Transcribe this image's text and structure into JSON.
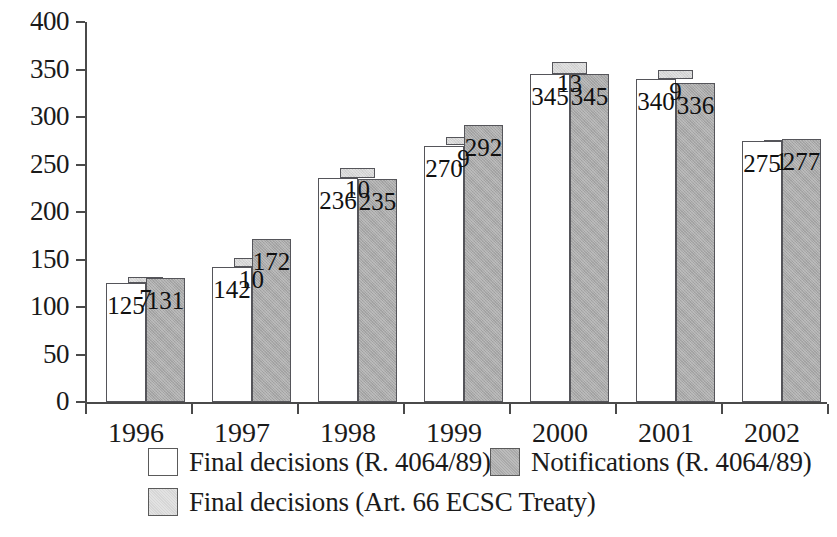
{
  "chart_data": {
    "type": "bar",
    "title": "",
    "subtitle": "",
    "xlabel": "",
    "ylabel": "",
    "categories": [
      "1996",
      "1997",
      "1998",
      "1999",
      "2000",
      "2001",
      "2002"
    ],
    "ylim": [
      0,
      400
    ],
    "yticks": [
      0,
      50,
      100,
      150,
      200,
      250,
      300,
      350,
      400
    ],
    "ytick_labels": [
      "0",
      "50",
      "100",
      "150",
      "200",
      "250",
      "300",
      "350",
      "400"
    ],
    "grid": false,
    "legend_position": "bottom-left",
    "stacking": "light-gray series is drawn stacked on top of the white series",
    "series": [
      {
        "name": "Final decisions (R. 4064/89)",
        "color": "#ffffff",
        "values": [
          125,
          142,
          236,
          270,
          345,
          340,
          275
        ],
        "labels": [
          "125",
          "142",
          "236",
          "270",
          "345",
          "340",
          "275"
        ]
      },
      {
        "name": "Notifications (R. 4064/89)",
        "color": "#a9a9a9",
        "values": [
          131,
          172,
          235,
          292,
          345,
          336,
          277
        ],
        "labels": [
          "131",
          "172",
          "235",
          "292",
          "345",
          "336",
          "277"
        ]
      },
      {
        "name": "Final decisions (Art. 66 ECSC Treaty)",
        "color": "#d6d6d6",
        "values": [
          7,
          10,
          10,
          9,
          13,
          9,
          1
        ],
        "labels": [
          "7",
          "10",
          "10",
          "9",
          "13",
          "9",
          "1"
        ]
      }
    ]
  },
  "axis": {
    "y_ticks": [
      "400",
      "350",
      "300",
      "250",
      "200",
      "150",
      "100",
      "50",
      "0"
    ],
    "x_ticks": [
      "1996",
      "1997",
      "1998",
      "1999",
      "2000",
      "2001",
      "2002"
    ]
  },
  "legend": {
    "items": [
      {
        "label": "Final decisions (R. 4064/89)",
        "swatch": "white",
        "color": "#ffffff"
      },
      {
        "label": "Notifications (R. 4064/89)",
        "swatch": "dark",
        "color": "#a9a9a9"
      },
      {
        "label": "Final decisions (Art. 66 ECSC Treaty)",
        "swatch": "light",
        "color": "#d6d6d6"
      }
    ]
  },
  "colors": {
    "white_series": "#ffffff",
    "dark_series": "#a9a9a9",
    "light_series": "#d6d6d6",
    "axis": "#4a4a4a",
    "text": "#1a1a1a"
  }
}
